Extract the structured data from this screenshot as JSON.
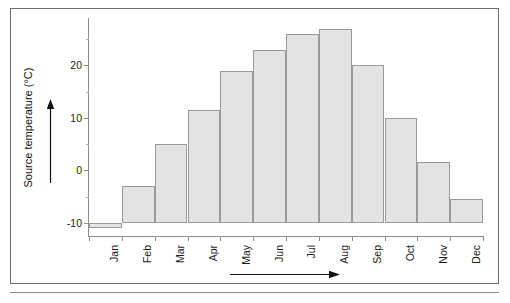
{
  "chart_data": {
    "type": "bar",
    "title": "",
    "subtitle": "",
    "xlabel": "",
    "ylabel": "Source temperature (°C)",
    "categories": [
      "Jan",
      "Feb",
      "Mar",
      "Apr",
      "May",
      "Jun",
      "Jul",
      "Aug",
      "Sep",
      "Oct",
      "Nov",
      "Dec"
    ],
    "values": [
      -11,
      -3,
      5,
      11.5,
      19,
      23,
      26,
      27,
      20,
      10,
      1.5,
      -5.5
    ],
    "ylim": [
      -12.5,
      29
    ],
    "ytick_labels": [
      "20",
      "10",
      "0",
      "-10"
    ],
    "ytick_values": [
      20,
      10,
      0,
      -10
    ],
    "yminor_step": 5,
    "grid": false,
    "legend": null,
    "bar_fill": "#e3e3e3",
    "bar_edge": "#9a9a9a",
    "axis_color": "#8c8c8c"
  },
  "axes": {
    "y_title": "Source temperature (°C)",
    "y_arrow_name": "y-axis-direction-arrow",
    "x_arrow_name": "x-axis-direction-arrow"
  }
}
